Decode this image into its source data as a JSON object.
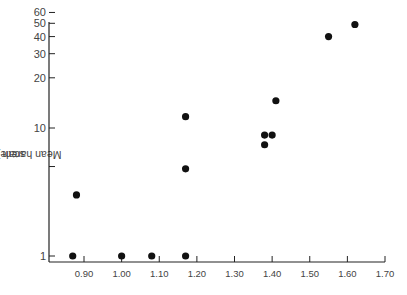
{
  "chart_data": {
    "type": "scatter",
    "title": "",
    "xlabel": "",
    "ylabel": "Mean harem size (log10 scale)",
    "ylabel_parts": {
      "prefix": "Mean harem size (log",
      "sub": "10",
      "suffix": " scale)"
    },
    "yscale": "log",
    "xlim": [
      0.81,
      1.7
    ],
    "ylim": [
      1,
      60
    ],
    "grid": false,
    "legend": null,
    "x_ticks": [
      0.9,
      1.0,
      1.1,
      1.2,
      1.3,
      1.4,
      1.5,
      1.6,
      1.7
    ],
    "x_tick_labels": [
      "0.90",
      "1.00",
      "1.10",
      "1.20",
      "1.30",
      "1.40",
      "1.50",
      "1.60",
      "1.70"
    ],
    "y_ticks": [
      1,
      5,
      10,
      20,
      30,
      40,
      50,
      60
    ],
    "y_tick_labels": [
      "1",
      "",
      "10",
      "20",
      "30",
      "40",
      "50",
      "60"
    ],
    "series": [
      {
        "name": "species",
        "marker": "filled-circle",
        "color": "#111111",
        "points": [
          {
            "x": 0.87,
            "y": 1
          },
          {
            "x": 0.88,
            "y": 3
          },
          {
            "x": 1.0,
            "y": 1
          },
          {
            "x": 1.08,
            "y": 1
          },
          {
            "x": 1.17,
            "y": 1
          },
          {
            "x": 1.17,
            "y": 4.8
          },
          {
            "x": 1.17,
            "y": 10.4
          },
          {
            "x": 1.38,
            "y": 7.4
          },
          {
            "x": 1.38,
            "y": 8.8
          },
          {
            "x": 1.4,
            "y": 8.8
          },
          {
            "x": 1.41,
            "y": 13.6
          },
          {
            "x": 1.55,
            "y": 40
          },
          {
            "x": 1.62,
            "y": 49
          }
        ]
      }
    ]
  }
}
